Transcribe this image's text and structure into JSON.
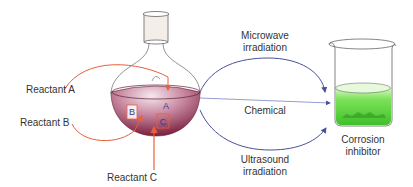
{
  "reactants": {
    "a": "Reactant A",
    "b": "Reactant B",
    "c": "Reactant C"
  },
  "flask_labels": {
    "a": "A",
    "b": "B",
    "c": "C"
  },
  "pathways": {
    "microwave_line1": "Microwave",
    "microwave_line2": "irradiation",
    "chemical": "Chemical",
    "ultrasound_line1": "Ultrasound",
    "ultrasound_line2": "irradiation"
  },
  "product": {
    "line1": "Corrosion",
    "line2": "inhibitor"
  },
  "colors": {
    "reactant_arrow": "#e8603c",
    "pathway_arrow": "#4a4f9e",
    "flask_liquid": "#9c3a5a",
    "beaker_liquid": "#5fd63a"
  }
}
